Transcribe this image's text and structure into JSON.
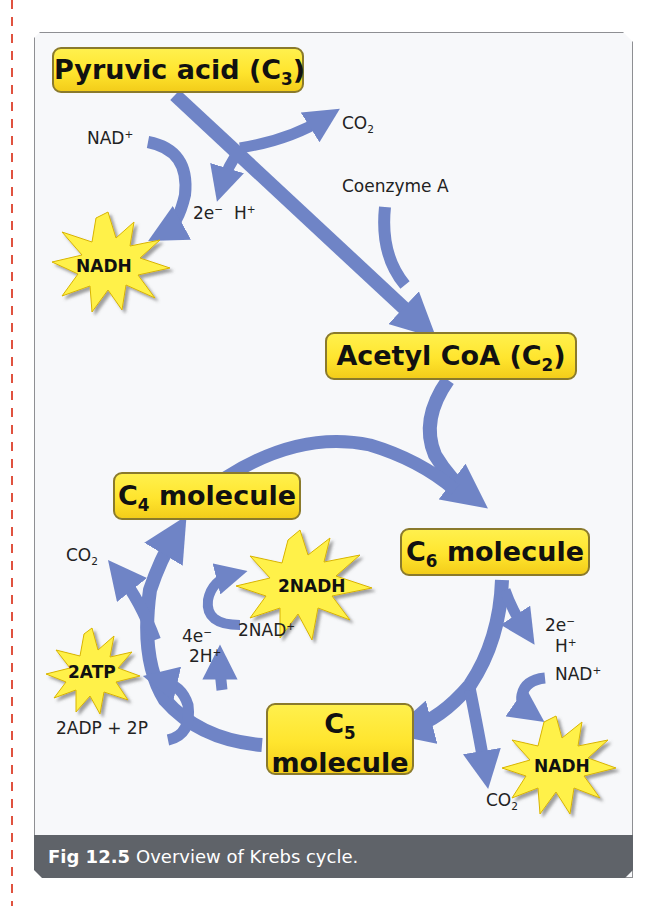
{
  "figure": {
    "caption_number": "Fig 12.5",
    "caption_text": "Overview of Krebs cycle.",
    "colors": {
      "arrow": "#6f84c6",
      "box_fill": "#ffe52e",
      "box_border": "#8a7a2c",
      "burst_fill": "#fff14a",
      "caption_bg": "#5f6369",
      "margin_line": "#e0523f"
    }
  },
  "boxes": {
    "pyruvic": {
      "text": "Pyruvic acid (C",
      "sub": "3",
      "tail": ")"
    },
    "acetyl": {
      "text": "Acetyl CoA (C",
      "sub": "2",
      "tail": ")"
    },
    "c4": {
      "pre": "C",
      "sub": "4",
      "text": " molecule"
    },
    "c6": {
      "pre": "C",
      "sub": "6",
      "text": " molecule"
    },
    "c5": {
      "pre": "C",
      "sub": "5",
      "text": "molecule"
    }
  },
  "bursts": {
    "nadh_top": "NADH",
    "nadh_2": "2NADH",
    "atp_2": "2ATP",
    "nadh_bottom": "NADH"
  },
  "labels": {
    "nad_plus_top": "NAD",
    "electrons_top": "2e",
    "h_plus_top": "H",
    "co2_top": "CO",
    "coenzyme_a": "Coenzyme A",
    "co2_left": "CO",
    "nad_2": "2NAD",
    "e4": "4e",
    "h2": "2H",
    "adp": "2ADP + 2P",
    "e2_right": "2e",
    "h_right": "H",
    "nad_right": "NAD",
    "co2_bottom": "CO",
    "plus": "+",
    "minus": "−",
    "two": "2"
  }
}
